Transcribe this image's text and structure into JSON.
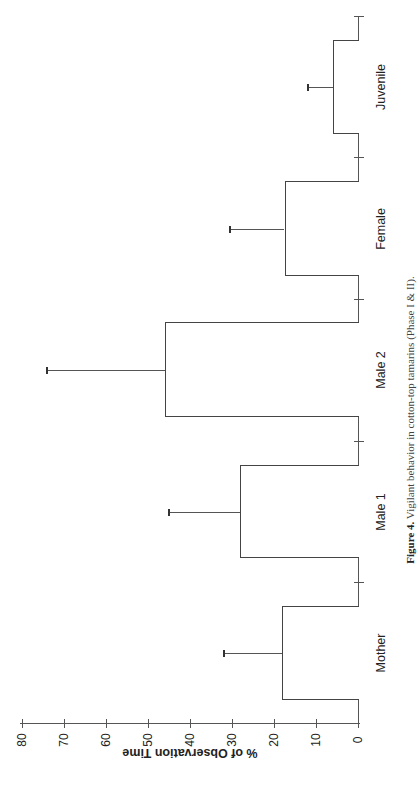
{
  "chart_data": {
    "type": "bar",
    "orientation": "rotated-90 (page rotated; categories along vertical, values along horizontal)",
    "title": "",
    "caption_label": "Figure 4.",
    "caption_text": "Vigilant behavior in cotton-top tamarins (Phase I & II).",
    "categories": [
      "Mother",
      "Male 1",
      "Male 2",
      "Female",
      "Juvenile"
    ],
    "values": [
      18,
      28,
      46,
      17.5,
      6
    ],
    "error_upper": [
      32,
      45,
      74,
      30.5,
      12
    ],
    "xlabel": "",
    "ylabel": "% of Observation Time",
    "ylim": [
      0,
      80
    ],
    "yticks": [
      0,
      10,
      20,
      30,
      40,
      50,
      60,
      70,
      80
    ],
    "grid": false,
    "legend": null
  }
}
